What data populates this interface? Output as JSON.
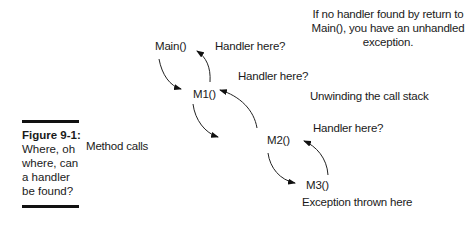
{
  "figure": {
    "label": "Figure 9-1:",
    "caption": "Where, oh where, can a handler be found?"
  },
  "note": "If no handler found by return to Main(), you have an unhandled exception.",
  "side_labels": {
    "method_calls": "Method calls",
    "unwinding": "Unwinding the call stack"
  },
  "nodes": [
    {
      "id": "main",
      "label": "Main()",
      "handler_label": "Handler here?"
    },
    {
      "id": "m1",
      "label": "M1()",
      "handler_label": "Handler here?"
    },
    {
      "id": "m2",
      "label": "M2()",
      "handler_label": "Handler here?"
    },
    {
      "id": "m3",
      "label": "M3()",
      "handler_label": "Exception thrown here"
    }
  ],
  "edges": [
    {
      "from": "Main()",
      "to": "M1()",
      "type": "call"
    },
    {
      "from": "M1()",
      "to": "M2()",
      "type": "call"
    },
    {
      "from": "M2()",
      "to": "M3()",
      "type": "call"
    },
    {
      "from": "M3()",
      "to": "M2()",
      "type": "unwind"
    },
    {
      "from": "M2()",
      "to": "M1()",
      "type": "unwind"
    },
    {
      "from": "M1()",
      "to": "Main()",
      "type": "unwind"
    }
  ]
}
